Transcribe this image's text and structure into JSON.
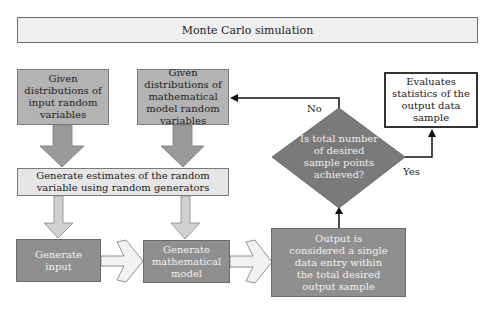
{
  "title": "Monte Carlo simulation",
  "nodes": {
    "input_distributions": "Given distributions of input random variables",
    "model_distributions": "Given distributions of mathematical model random variables",
    "generate_estimates": "Generate estimates of the random variable using random generators",
    "generate_input": "Generate input",
    "generate_model": "Generate mathematical model",
    "output": "Output is considered a single data entry within the total desired output sample",
    "decision": "Is total number of desired sample points achieved?",
    "evaluate": "Evaluates statistics of the output data sample"
  },
  "edges": {
    "no_label": "No",
    "yes_label": "Yes"
  },
  "colors": {
    "dark_gray_fill": "#8f8f8f",
    "mid_gray_fill": "#b3b3b3",
    "light_gray_fill": "#e6e6e6",
    "diamond_fill": "#7a7a7a",
    "arrow_dark": "#9a9a9a",
    "arrow_light": "#d9d9d9"
  }
}
